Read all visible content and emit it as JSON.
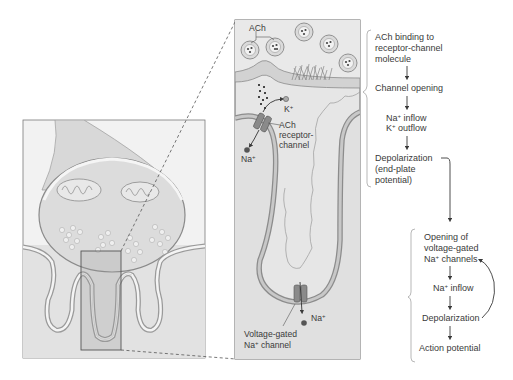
{
  "figure": {
    "left_panel": {
      "name": "neuromuscular-junction-overview"
    },
    "right_panel": {
      "labels": {
        "ach": "ACh",
        "k_ion": "K",
        "na_ion_top": "Na",
        "ach_receptor_line1": "ACh",
        "ach_receptor_line2": "receptor-",
        "ach_receptor_line3": "channel",
        "na_ion_bottom": "Na",
        "voltage_gated_line1": "Voltage-gated",
        "voltage_gated_line2_pre": "Na",
        "voltage_gated_line2_post": " channel",
        "plus": "+"
      }
    },
    "flow_top": {
      "steps": [
        {
          "lines": [
            "ACh binding to",
            "receptor-channel",
            "molecule"
          ]
        },
        {
          "lines": [
            "Channel opening"
          ]
        },
        {
          "lines": [
            "Na+ inflow",
            "K+ outflow"
          ]
        },
        {
          "lines": [
            "Depolarization",
            "(end-plate",
            "potential)"
          ]
        }
      ],
      "s1l1": "ACh binding to",
      "s1l2": "receptor-channel",
      "s1l3": "molecule",
      "s2l1": "Channel opening",
      "s3l1_pre": "Na",
      "s3l1_post": " inflow",
      "s3l2_pre": "K",
      "s3l2_post": " outflow",
      "s4l1": "Depolarization",
      "s4l2": "(end-plate",
      "s4l3": "potential)"
    },
    "flow_bottom": {
      "steps": [
        {
          "lines": [
            "Opening of",
            "voltage-gated",
            "Na+ channels"
          ]
        },
        {
          "lines": [
            "Na+ inflow"
          ]
        },
        {
          "lines": [
            "Depolarization"
          ]
        },
        {
          "lines": [
            "Action potential"
          ]
        }
      ],
      "s1l1": "Opening of",
      "s1l2": "voltage-gated",
      "s1l3_pre": "Na",
      "s1l3_post": " channels",
      "s2l1_pre": "Na",
      "s2l1_post": " inflow",
      "s3l1": "Depolarization",
      "s4l1": "Action potential",
      "plus": "+"
    },
    "colors": {
      "panel_fill": "#e4e4e4",
      "membrane": "#a8a8a8",
      "outline": "#6a6a6a",
      "text": "#3a3a3a",
      "vesicle": "#c8c8c8",
      "ion": "#555555"
    }
  }
}
